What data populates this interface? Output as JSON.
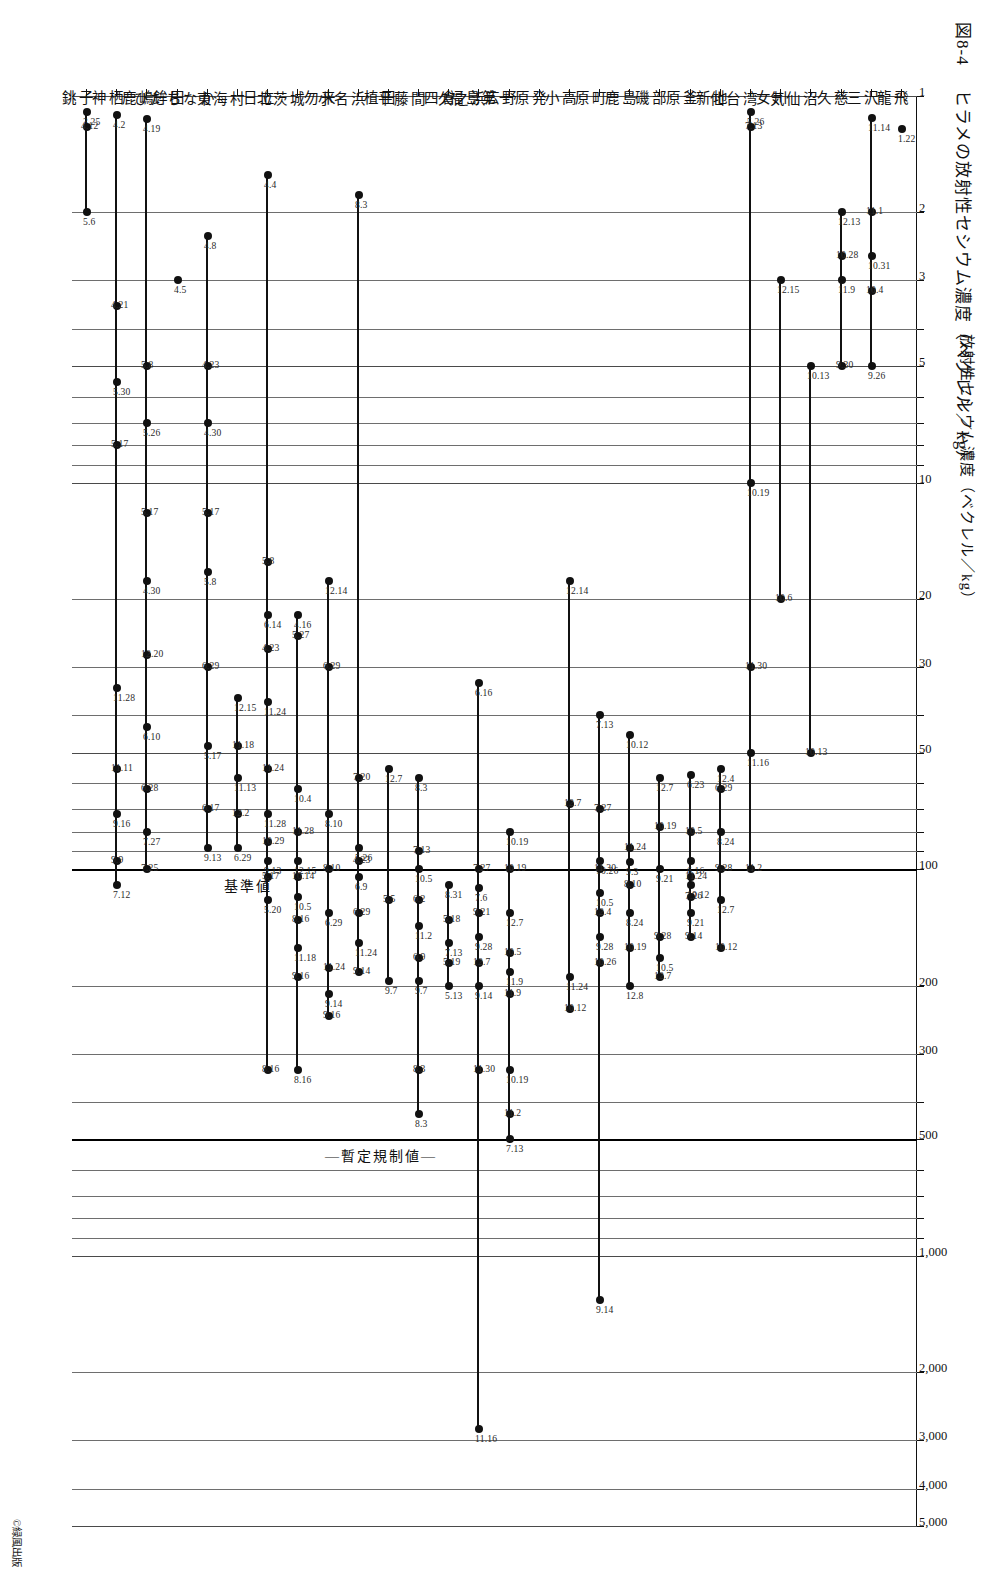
{
  "figure": {
    "caption_number": "図8-4",
    "caption_text": "ヒラメの放射性セシウム濃度（ベクレル／kg）",
    "copyright": "©緑風出版",
    "axis_title": "放射性セシウム濃度（ベクレル／kg）"
  },
  "reference_lines": [
    {
      "label": "暫定規制値",
      "value": 500
    },
    {
      "label": "基準値",
      "value": 100
    }
  ],
  "chart_data": {
    "type": "scatter",
    "title": "ヒラメの放射性セシウム濃度（ベクレル／kg）",
    "xlabel": "放射性セシウム濃度（ベクレル／kg）",
    "ylabel": "",
    "xscale": "log",
    "xlim": [
      1,
      5000
    ],
    "xticks": [
      1,
      2,
      3,
      5,
      10,
      20,
      30,
      50,
      100,
      200,
      300,
      500,
      1000,
      2000,
      3000,
      4000,
      5000
    ],
    "xticklabels": [
      "1",
      "2",
      "3",
      "5",
      "10",
      "20",
      "30",
      "50",
      "100",
      "200",
      "300",
      "500",
      "1,000",
      "2,000",
      "3,000",
      "4,000",
      "5,000"
    ],
    "grid": true,
    "legend": "none",
    "reference_lines": [
      {
        "label": "暫定規制値",
        "value": 500
      },
      {
        "label": "基準値",
        "value": 100
      }
    ],
    "categories": [
      "龍飛",
      "三沢",
      "久慈",
      "気仙沼",
      "女川",
      "仙台湾",
      "新地",
      "原釜",
      "磯部",
      "鹿島",
      "原町",
      "小高",
      "福島第一原発",
      "広野",
      "久之浜",
      "四倉",
      "平藤間",
      "植田",
      "小名浜",
      "勿来",
      "北茨城",
      "日立",
      "東海村",
      "ひたちなか",
      "鉾田",
      "鹿嶋",
      "神栖",
      "銚子"
    ],
    "series": [
      {
        "category": "龍飛",
        "points": [
          {
            "value": 1.22,
            "date": "1.22"
          }
        ]
      },
      {
        "category": "三沢",
        "points": [
          {
            "value": 1.14,
            "date": "11.14"
          },
          {
            "value": 2.0,
            "date": "11.1"
          },
          {
            "value": 2.6,
            "date": "10.31"
          },
          {
            "value": 3.2,
            "date": "10.4"
          },
          {
            "value": 5.0,
            "date": "9.26"
          }
        ]
      },
      {
        "category": "久慈",
        "points": [
          {
            "value": 2.0,
            "date": "12.13"
          },
          {
            "value": 2.6,
            "date": "10.28"
          },
          {
            "value": 3.0,
            "date": "11.9"
          },
          {
            "value": 5.0,
            "date": "9.30"
          }
        ]
      },
      {
        "category": "気仙沼",
        "points": [
          {
            "value": 5.0,
            "date": "10.13"
          },
          {
            "value": 50,
            "date": "10.13"
          }
        ]
      },
      {
        "category": "女川",
        "points": [
          {
            "value": 3.0,
            "date": "12.15"
          },
          {
            "value": 20,
            "date": "10.6"
          }
        ]
      },
      {
        "category": "仙台湾",
        "points": [
          {
            "value": 1.1,
            "date": "5.26"
          },
          {
            "value": 1.2,
            "date": "7.13"
          },
          {
            "value": 10,
            "date": "10.19"
          },
          {
            "value": 30,
            "date": "11.30"
          },
          {
            "value": 50,
            "date": "11.16"
          },
          {
            "value": 100,
            "date": "11.2"
          }
        ]
      },
      {
        "category": "新地",
        "points": [
          {
            "value": 55,
            "date": "12.4"
          },
          {
            "value": 62,
            "date": "6.29"
          },
          {
            "value": 80,
            "date": "8.24"
          },
          {
            "value": 100,
            "date": "9.28"
          },
          {
            "value": 120,
            "date": "12.7"
          },
          {
            "value": 160,
            "date": "10.12"
          }
        ]
      },
      {
        "category": "原釜",
        "points": [
          {
            "value": 57,
            "date": "6.23"
          },
          {
            "value": 80,
            "date": "10.5"
          },
          {
            "value": 95,
            "date": "6.16"
          },
          {
            "value": 105,
            "date": "11.24"
          },
          {
            "value": 110,
            "date": "10.12"
          },
          {
            "value": 118,
            "date": "7.26"
          },
          {
            "value": 130,
            "date": "9.21"
          },
          {
            "value": 150,
            "date": "9.14"
          }
        ]
      },
      {
        "category": "磯部",
        "points": [
          {
            "value": 58,
            "date": "12.7"
          },
          {
            "value": 78,
            "date": "10.19"
          },
          {
            "value": 100,
            "date": "9.21"
          },
          {
            "value": 150,
            "date": "9.28"
          },
          {
            "value": 170,
            "date": "10.5"
          },
          {
            "value": 190,
            "date": "12.7"
          }
        ]
      },
      {
        "category": "鹿島",
        "points": [
          {
            "value": 45,
            "date": "10.12"
          },
          {
            "value": 88,
            "date": "11.24"
          },
          {
            "value": 96,
            "date": "9.3"
          },
          {
            "value": 110,
            "date": "8.10"
          },
          {
            "value": 130,
            "date": "8.24"
          },
          {
            "value": 160,
            "date": "10.19"
          },
          {
            "value": 200,
            "date": "12.8"
          }
        ]
      },
      {
        "category": "原町",
        "points": [
          {
            "value": 40,
            "date": "7.13"
          },
          {
            "value": 70,
            "date": "7.27"
          },
          {
            "value": 95,
            "date": "10.26"
          },
          {
            "value": 100,
            "date": "11.30"
          },
          {
            "value": 115,
            "date": "10.5"
          },
          {
            "value": 130,
            "date": "12.4"
          },
          {
            "value": 150,
            "date": "9.28"
          },
          {
            "value": 175,
            "date": "10.26"
          },
          {
            "value": 1300,
            "date": "9.14"
          }
        ]
      },
      {
        "category": "小高",
        "points": [
          {
            "value": 18,
            "date": "12.14"
          },
          {
            "value": 68,
            "date": "12.7"
          },
          {
            "value": 190,
            "date": "11.24"
          },
          {
            "value": 230,
            "date": "10.12"
          }
        ]
      },
      {
        "category": "福島第一原発",
        "points": []
      },
      {
        "category": "広野",
        "points": [
          {
            "value": 80,
            "date": "10.19"
          },
          {
            "value": 100,
            "date": "10.19"
          },
          {
            "value": 130,
            "date": "12.7"
          },
          {
            "value": 165,
            "date": "10.5"
          },
          {
            "value": 185,
            "date": "11.9"
          },
          {
            "value": 210,
            "date": "11.9"
          },
          {
            "value": 330,
            "date": "10.19"
          },
          {
            "value": 430,
            "date": "11.2"
          },
          {
            "value": 500,
            "date": "7.13"
          }
        ]
      },
      {
        "category": "久之浜",
        "points": [
          {
            "value": 33,
            "date": "6.16"
          },
          {
            "value": 100,
            "date": "7.27"
          },
          {
            "value": 112,
            "date": "7.6"
          },
          {
            "value": 130,
            "date": "9.21"
          },
          {
            "value": 150,
            "date": "9.28"
          },
          {
            "value": 175,
            "date": "12.7"
          },
          {
            "value": 200,
            "date": "9.14"
          },
          {
            "value": 330,
            "date": "11.30"
          },
          {
            "value": 2800,
            "date": "11.16"
          }
        ]
      },
      {
        "category": "四倉",
        "points": [
          {
            "value": 110,
            "date": "8.31"
          },
          {
            "value": 135,
            "date": "5.18"
          },
          {
            "value": 155,
            "date": "7.13"
          },
          {
            "value": 175,
            "date": "5.19"
          },
          {
            "value": 200,
            "date": "5.13"
          }
        ]
      },
      {
        "category": "平藤間",
        "points": [
          {
            "value": 58,
            "date": "8.3"
          },
          {
            "value": 90,
            "date": "7.13"
          },
          {
            "value": 100,
            "date": "10.5"
          },
          {
            "value": 120,
            "date": "6.2"
          },
          {
            "value": 140,
            "date": "11.2"
          },
          {
            "value": 170,
            "date": "6.9"
          },
          {
            "value": 195,
            "date": "9.7"
          },
          {
            "value": 330,
            "date": "8.3"
          },
          {
            "value": 430,
            "date": "8.3"
          }
        ]
      },
      {
        "category": "植田",
        "points": [
          {
            "value": 55,
            "date": "12.7"
          },
          {
            "value": 120,
            "date": "5.5"
          },
          {
            "value": 195,
            "date": "9.7"
          }
        ]
      },
      {
        "category": "小名浜",
        "points": [
          {
            "value": 1.8,
            "date": "8.3"
          },
          {
            "value": 58,
            "date": "7.20"
          },
          {
            "value": 88,
            "date": "5.26"
          },
          {
            "value": 95,
            "date": "4.23"
          },
          {
            "value": 105,
            "date": "6.9"
          },
          {
            "value": 130,
            "date": "6.29"
          },
          {
            "value": 155,
            "date": "11.24"
          },
          {
            "value": 185,
            "date": "9.14"
          }
        ]
      },
      {
        "category": "勿来",
        "points": [
          {
            "value": 18,
            "date": "12.14"
          },
          {
            "value": 30,
            "date": "6.29"
          },
          {
            "value": 72,
            "date": "8.10"
          },
          {
            "value": 100,
            "date": "8.10"
          },
          {
            "value": 130,
            "date": "6.29"
          },
          {
            "value": 180,
            "date": "11.24"
          },
          {
            "value": 210,
            "date": "9.14"
          },
          {
            "value": 240,
            "date": "9.16"
          }
        ]
      },
      {
        "category": "北茨城",
        "points": [
          {
            "value": 22,
            "date": "4.16"
          },
          {
            "value": 25,
            "date": "5.27"
          },
          {
            "value": 62,
            "date": "10.4"
          },
          {
            "value": 80,
            "date": "11.28"
          },
          {
            "value": 95,
            "date": "12.15"
          },
          {
            "value": 105,
            "date": "10.14"
          },
          {
            "value": 118,
            "date": "10.5"
          },
          {
            "value": 135,
            "date": "8.16"
          },
          {
            "value": 160,
            "date": "11.18"
          },
          {
            "value": 190,
            "date": "9.16"
          },
          {
            "value": 330,
            "date": "8.16"
          }
        ]
      },
      {
        "category": "日立",
        "points": [
          {
            "value": 1.6,
            "date": "4.4"
          },
          {
            "value": 16,
            "date": "5.8"
          },
          {
            "value": 22,
            "date": "6.14"
          },
          {
            "value": 27,
            "date": "4.23"
          },
          {
            "value": 37,
            "date": "11.24"
          },
          {
            "value": 55,
            "date": "11.24"
          },
          {
            "value": 72,
            "date": "11.28"
          },
          {
            "value": 85,
            "date": "10.29"
          },
          {
            "value": 95,
            "date": "9.13"
          },
          {
            "value": 105,
            "date": "5.17"
          },
          {
            "value": 120,
            "date": "5.20"
          },
          {
            "value": 330,
            "date": "8.16"
          }
        ]
      },
      {
        "category": "東海村",
        "points": [
          {
            "value": 36,
            "date": "12.15"
          },
          {
            "value": 48,
            "date": "11.18"
          },
          {
            "value": 58,
            "date": "11.13"
          },
          {
            "value": 72,
            "date": "12.2"
          },
          {
            "value": 88,
            "date": "6.29"
          }
        ]
      },
      {
        "category": "ひたちなか",
        "points": [
          {
            "value": 2.3,
            "date": "4.8"
          },
          {
            "value": 5.0,
            "date": "4.23"
          },
          {
            "value": 7.0,
            "date": "4.30"
          },
          {
            "value": 12,
            "date": "5.17"
          },
          {
            "value": 17,
            "date": "5.8"
          },
          {
            "value": 30,
            "date": "6.29"
          },
          {
            "value": 48,
            "date": "5.17"
          },
          {
            "value": 70,
            "date": "6.17"
          },
          {
            "value": 88,
            "date": "9.13"
          }
        ]
      },
      {
        "category": "鉾田",
        "points": [
          {
            "value": 3.0,
            "date": "4.5"
          }
        ]
      },
      {
        "category": "鹿嶋",
        "points": [
          {
            "value": 1.15,
            "date": "4.19"
          },
          {
            "value": 5.0,
            "date": "5.8"
          },
          {
            "value": 7.0,
            "date": "5.26"
          },
          {
            "value": 12,
            "date": "5.17"
          },
          {
            "value": 18,
            "date": "4.30"
          },
          {
            "value": 28,
            "date": "12.20"
          },
          {
            "value": 43,
            "date": "6.10"
          },
          {
            "value": 62,
            "date": "6.28"
          },
          {
            "value": 80,
            "date": "7.27"
          },
          {
            "value": 100,
            "date": "7.25"
          }
        ]
      },
      {
        "category": "神栖",
        "points": [
          {
            "value": 1.12,
            "date": "4.2"
          },
          {
            "value": 3.5,
            "date": "4.21"
          },
          {
            "value": 5.5,
            "date": "5.30"
          },
          {
            "value": 8.0,
            "date": "5.17"
          },
          {
            "value": 34,
            "date": "11.28"
          },
          {
            "value": 55,
            "date": "11.11"
          },
          {
            "value": 72,
            "date": "9.16"
          },
          {
            "value": 95,
            "date": "9.9"
          },
          {
            "value": 110,
            "date": "7.12"
          }
        ]
      },
      {
        "category": "銚子",
        "points": [
          {
            "value": 1.1,
            "date": "3.25"
          },
          {
            "value": 1.2,
            "date": "4.12"
          },
          {
            "value": 2.0,
            "date": "5.6"
          }
        ]
      }
    ]
  }
}
